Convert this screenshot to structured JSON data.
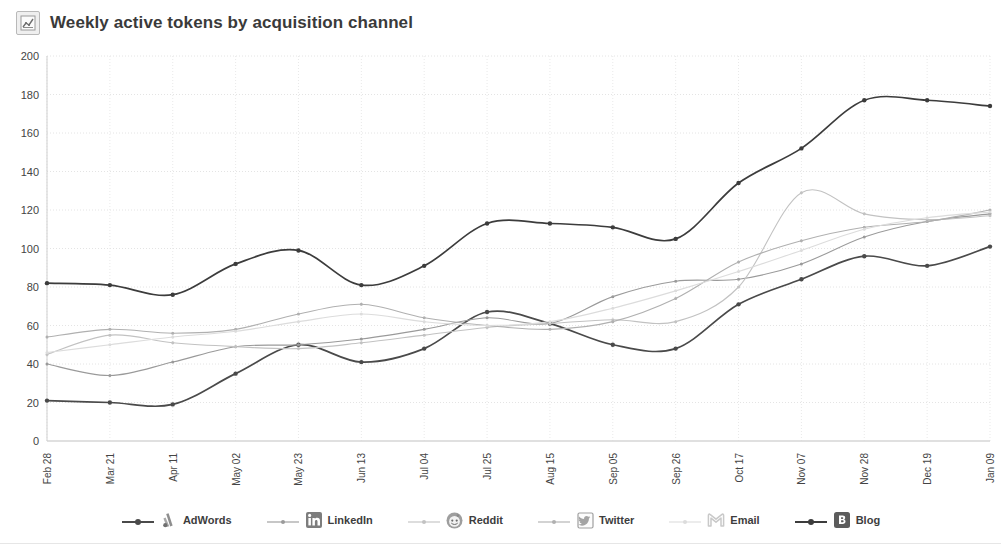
{
  "header": {
    "title": "Weekly active tokens by acquisition channel",
    "icon": "chart-icon"
  },
  "chart_data": {
    "type": "line",
    "title": "Weekly active tokens by acquisition channel",
    "xlabel": "",
    "ylabel": "",
    "ylim": [
      0,
      200
    ],
    "ytick_step": 20,
    "yticks": [
      "200",
      "180",
      "160",
      "140",
      "120",
      "100",
      "80",
      "60",
      "40",
      "20",
      "0"
    ],
    "grid": true,
    "legend_position": "bottom",
    "smoothing": "spline",
    "markers": true,
    "categories": [
      "Feb 28",
      "Mar 21",
      "Apr 11",
      "May 02",
      "May 23",
      "Jun 13",
      "Jul 04",
      "Jul 25",
      "Aug 15",
      "Sep 05",
      "Sep 26",
      "Oct 17",
      "Nov 07",
      "Nov 28",
      "Dec 19",
      "Jan 09"
    ],
    "series": [
      {
        "name": "AdWords",
        "icon": "adwords-icon",
        "color": "#4a4a4a",
        "values": [
          21,
          20,
          19,
          35,
          50,
          41,
          48,
          67,
          61,
          50,
          48,
          71,
          84,
          96,
          91,
          101
        ]
      },
      {
        "name": "LinkedIn",
        "icon": "linkedin-icon",
        "color": "#9a9a9a",
        "values": [
          40,
          34,
          41,
          49,
          50,
          53,
          58,
          64,
          61,
          75,
          83,
          84,
          92,
          106,
          114,
          118
        ]
      },
      {
        "name": "Reddit",
        "icon": "reddit-icon",
        "color": "#c2c2c2",
        "values": [
          45,
          55,
          51,
          49,
          48,
          51,
          55,
          59,
          61,
          63,
          62,
          80,
          129,
          118,
          115,
          117
        ]
      },
      {
        "name": "Twitter",
        "icon": "twitter-icon",
        "color": "#b0b0b0",
        "values": [
          54,
          58,
          56,
          58,
          66,
          71,
          64,
          60,
          58,
          62,
          74,
          93,
          104,
          111,
          114,
          120
        ]
      },
      {
        "name": "Email",
        "icon": "email-icon",
        "color": "#dcdcdc",
        "values": [
          46,
          50,
          54,
          57,
          62,
          66,
          62,
          60,
          62,
          69,
          78,
          88,
          99,
          110,
          116,
          119
        ]
      },
      {
        "name": "Blog",
        "icon": "blog-icon",
        "color": "#3c3c3c",
        "values": [
          82,
          81,
          76,
          92,
          99,
          81,
          91,
          113,
          113,
          111,
          105,
          134,
          152,
          177,
          177,
          174
        ]
      }
    ]
  }
}
